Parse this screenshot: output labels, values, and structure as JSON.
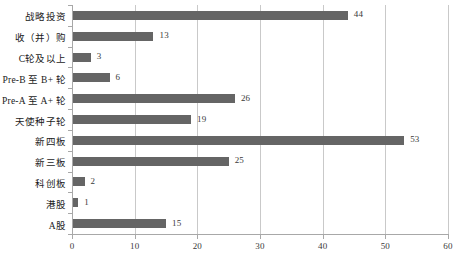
{
  "chart_data": {
    "type": "bar",
    "orientation": "horizontal",
    "title": "",
    "xlabel": "",
    "ylabel": "",
    "xlim": [
      0,
      60
    ],
    "ylim": null,
    "grid": true,
    "legend": false,
    "xticks": [
      "0",
      "10",
      "20",
      "30",
      "40",
      "50",
      "60"
    ],
    "xtick_values": [
      0,
      10,
      20,
      30,
      40,
      50,
      60
    ],
    "categories": [
      "战略投资",
      "收（并）购",
      "C轮及以上",
      "Pre-B 至 B+ 轮",
      "Pre-A 至 A+ 轮",
      "天使种子轮",
      "新四板",
      "新三板",
      "科创板",
      "港股",
      "A股"
    ],
    "values": [
      44,
      13,
      3,
      6,
      26,
      19,
      53,
      25,
      2,
      1,
      15
    ],
    "value_labels": [
      "44",
      "13",
      "3",
      "6",
      "26",
      "19",
      "53",
      "25",
      "2",
      "1",
      "15"
    ],
    "bar_color": "#656565",
    "grid_color": "#c9c9c9",
    "axis_color": "#a8a8a8",
    "text_color": "#1a1a1a"
  }
}
